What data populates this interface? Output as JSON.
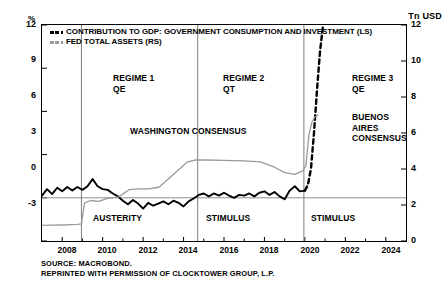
{
  "axes": {
    "left_unit": "%",
    "right_unit": "Tn USD",
    "left_ticks": [
      "12",
      "9",
      "6",
      "3",
      "0",
      "-3"
    ],
    "right_ticks": [
      "12",
      "10",
      "8",
      "6",
      "4",
      "2",
      "0"
    ],
    "x_ticks": [
      "2008",
      "2010",
      "2012",
      "2014",
      "2016",
      "2018",
      "2020",
      "2022",
      "2024"
    ]
  },
  "legend": {
    "items": [
      {
        "label": "CONTRIBUTION TO GDP: GOVERNMENT CONSUMPTION AND INVESTMENT (LS)",
        "color": "#000000",
        "style": "dashed-black"
      },
      {
        "label": "FED TOTAL ASSETS (RS)",
        "color": "#9a9a9a",
        "style": "dashed-gray"
      }
    ]
  },
  "annotations": {
    "regime1": "REGIME 1\nQE",
    "regime2": "REGIME 2\nQT",
    "regime3": "REGIME 3\nQE",
    "washington": "WASHINGTON CONSENSUS",
    "buenos_aires": "BUENOS\nAIRES\nCONSENSUS",
    "austerity": "AUSTERITY",
    "stimulus1": "STIMULUS",
    "stimulus2": "STIMULUS"
  },
  "source": {
    "line1": "SOURCE: MACROBOND.",
    "line2": "REPRINTED WITH PERMISSION OF CLOCKTOWER GROUP, L.P."
  },
  "chart_data": {
    "type": "line",
    "title": "",
    "xlabel": "",
    "ylabel": "%",
    "y2label": "Tn USD",
    "xlim": [
      2007.0,
      2025.0
    ],
    "ylim": [
      -3,
      12
    ],
    "y2lim": [
      0,
      12
    ],
    "grid": false,
    "legend_position": "top-left",
    "regime_dividers": [
      2008.95,
      2014.7,
      2019.95
    ],
    "series": [
      {
        "name": "CONTRIBUTION TO GDP: GOVERNMENT CONSUMPTION AND INVESTMENT (LS)",
        "axis": "left",
        "color": "#000000",
        "x": [
          2007.0,
          2007.25,
          2007.5,
          2007.75,
          2008.0,
          2008.25,
          2008.5,
          2008.75,
          2009.0,
          2009.25,
          2009.5,
          2009.75,
          2010.0,
          2010.25,
          2010.5,
          2010.75,
          2011.0,
          2011.25,
          2011.5,
          2011.75,
          2012.0,
          2012.25,
          2012.5,
          2012.75,
          2013.0,
          2013.25,
          2013.5,
          2013.75,
          2014.0,
          2014.25,
          2014.5,
          2014.75,
          2015.0,
          2015.25,
          2015.5,
          2015.75,
          2016.0,
          2016.25,
          2016.5,
          2016.75,
          2017.0,
          2017.25,
          2017.5,
          2017.75,
          2018.0,
          2018.25,
          2018.5,
          2018.75,
          2019.0,
          2019.25,
          2019.5,
          2019.75,
          2020.0
        ],
        "y": [
          0.15,
          0.6,
          0.25,
          0.7,
          0.45,
          0.75,
          0.5,
          0.75,
          0.55,
          0.8,
          1.3,
          0.8,
          0.6,
          0.55,
          0.3,
          0.1,
          -0.2,
          -0.45,
          -0.15,
          -0.4,
          -0.75,
          -0.35,
          -0.55,
          -0.4,
          -0.25,
          -0.45,
          -0.2,
          -0.35,
          -0.6,
          -0.25,
          -0.05,
          0.2,
          0.3,
          0.1,
          0.3,
          0.15,
          0.35,
          0.15,
          0.0,
          0.2,
          0.15,
          0.3,
          0.1,
          0.35,
          0.45,
          0.2,
          0.4,
          0.1,
          -0.1,
          0.5,
          0.8,
          0.45,
          0.5
        ]
      },
      {
        "name": "CONTRIBUTION TO GDP (projected / extreme spike, dashed)",
        "axis": "left",
        "color": "#000000",
        "style": "dashed",
        "x": [
          2020.0,
          2020.15,
          2020.3,
          2020.45,
          2020.6,
          2020.75,
          2020.9
        ],
        "y": [
          0.5,
          0.9,
          2.0,
          4.5,
          7.5,
          10.2,
          12.0
        ]
      },
      {
        "name": "FED TOTAL ASSETS (RS)",
        "axis": "right",
        "color": "#9a9a9a",
        "x": [
          2007.0,
          2007.5,
          2008.0,
          2008.5,
          2008.75,
          2008.95,
          2009.1,
          2009.4,
          2009.8,
          2010.2,
          2010.8,
          2011.3,
          2011.8,
          2012.3,
          2012.8,
          2013.3,
          2013.8,
          2014.2,
          2014.6,
          2015.0,
          2016.0,
          2017.0,
          2017.8,
          2018.5,
          2019.0,
          2019.5,
          2019.9,
          2020.05,
          2020.2,
          2020.35,
          2020.5,
          2020.65
        ],
        "y": [
          0.87,
          0.88,
          0.89,
          0.91,
          0.92,
          0.95,
          2.1,
          2.25,
          2.2,
          2.35,
          2.45,
          2.85,
          2.9,
          2.9,
          3.0,
          3.5,
          4.0,
          4.4,
          4.5,
          4.5,
          4.48,
          4.45,
          4.4,
          4.1,
          3.8,
          3.7,
          3.9,
          4.2,
          5.9,
          6.6,
          6.9,
          7.0
        ]
      }
    ]
  }
}
